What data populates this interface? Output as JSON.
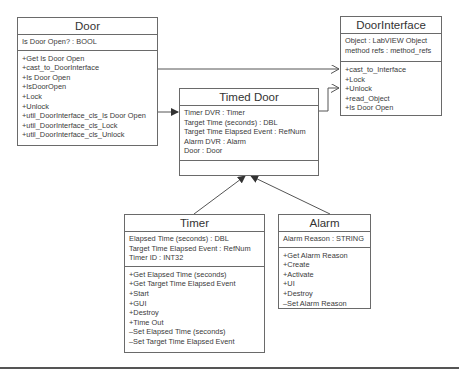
{
  "diagram": {
    "type": "UML class diagram",
    "classes": [
      {
        "id": "door",
        "name": "Door",
        "attributes": [
          "Is Door Open? : BOOL"
        ],
        "methods": [
          "+Get Is Door Open",
          "+cast_to_DoorInterface",
          "+Is Door Open",
          "+IsDoorOpen",
          "+Lock",
          "+Unlock",
          "+util_DoorInterface_cls_Is Door Open",
          "+util_DoorInterface_cls_Lock",
          "+util_DoorInterface_cls_Unlock"
        ]
      },
      {
        "id": "door_interface",
        "name": "DoorInterface",
        "attributes": [
          "Object : LabVIEW Object",
          "method refs : method_refs"
        ],
        "methods": [
          "+cast_to_Interface",
          "+Lock",
          "+Unlock",
          "+read_Object",
          "+Is Door Open"
        ]
      },
      {
        "id": "timed_door",
        "name": "Timed Door",
        "attributes": [
          "Timer DVR : Timer",
          "Target Time (seconds) : DBL",
          "Target Time Elapsed Event : RefNum",
          "Alarm DVR : Alarm",
          "Door : Door"
        ],
        "methods": []
      },
      {
        "id": "timer",
        "name": "Timer",
        "attributes": [
          "Elapsed Time (seconds) :  DBL",
          "Target Time Elapsed Event : RefNum",
          "Timer ID : INT32"
        ],
        "methods": [
          "+Get Elapsed Time (seconds)",
          "+Get Target Time Elapsed Event",
          "+Start",
          "+GUI",
          "+Destroy",
          "+Time Out",
          "–Set Elapsed Time (seconds)",
          "–Set Target Time Elapsed Event"
        ]
      },
      {
        "id": "alarm",
        "name": "Alarm",
        "attributes": [
          "Alarm Reason : STRING"
        ],
        "methods": [
          "+Get Alarm Reason",
          "+Create",
          "+Activate",
          "+UI",
          "+Destroy",
          "–Set Alarm Reason"
        ]
      }
    ],
    "relationships": [
      {
        "from": "door",
        "to": "door_interface",
        "kind": "open-arrow"
      },
      {
        "from": "door",
        "to": "timed_door",
        "kind": "filled-arrow"
      },
      {
        "from": "timed_door",
        "to": "door_interface",
        "kind": "open-arrow"
      },
      {
        "from": "timer",
        "to": "timed_door",
        "kind": "filled-arrow"
      },
      {
        "from": "alarm",
        "to": "timed_door",
        "kind": "filled-arrow"
      }
    ],
    "colors": {
      "line": "#555555",
      "border": "#6a6a6a",
      "text": "#3a3a3a",
      "background": "#ffffff"
    }
  }
}
